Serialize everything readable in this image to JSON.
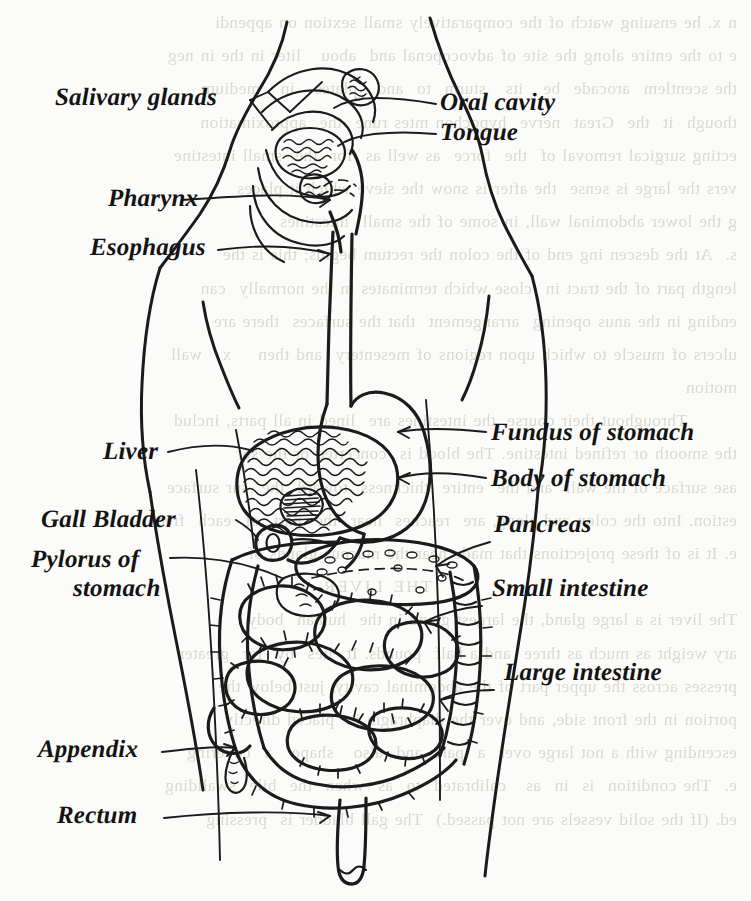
{
  "document": {
    "kind": "scanned-textbook-illustration",
    "subject": "Human digestive system",
    "ink_color": "#1b1b1b",
    "paper_color": "#fbfbf9",
    "bleed_color": "#8d8a85"
  },
  "labels": {
    "salivary_glands": "Salivary glands",
    "pharynx": "Pharynx",
    "esophagus": "Esophagus",
    "liver": "Liver",
    "gall_bladder": "Gall Bladder",
    "pylorus_line1": "Pylorus of",
    "pylorus_line2": "stomach",
    "appendix": "Appendix",
    "rectum": "Rectum",
    "oral_cavity": "Oral cavity",
    "tongue": "Tongue",
    "fundus_of_stomach": "Fundus of stomach",
    "body_of_stomach": "Body of stomach",
    "pancreas": "Pancreas",
    "small_intestine": "Small intestine",
    "large_intestine": "Large intestine"
  },
  "bleed_text": {
    "lines": [
      "n x. he ensuing watch of the comparatively small sextion on appendi",
      "e to the entire along the site of advocopenal and  abou   liter in the in neg",
      "the scentlem  arocade  be   its   sturm  to  and   plates   in   medium",
      "though  it  the  Great  nerve  hypochon mtes rune  the  approximation",
      "ecting surgical removal of  the  force  as well as  for  the  small intestine",
      "vers the large is sense  the after is snow the sieve which it places",
      "g the lower abdominal wall, in some of the small  intestines",
      "s.  At the descen ing end of the colon the rectum begins; this is the",
      "length part of the tract in  close which terminates in the normally  can",
      "ending in the anus opening  arrangement  that the surfaces  there are",
      "ulcers of muscle to which upon regions of mesentery  and then    x   wall",
      "motion",
      "   Throughout their course, the intestines are  lined in all parts, includ",
      "the smooth or refined intestine. The blood is  concerted or the sur",
      "ase surface of the wall  and the  entire  thickness  toward  the  sur surface",
      "estion. Into the colon and along, are  reaches  near  the  part  of  each  free",
      "e. It is of these projections that made near the mucous glands of",
      "THE LIVER",
      "The liver is a large gland, the largest gland in the  human  body",
      "ary weight as much as three  and a half  pounds. It  lies  by  far  greater",
      "presses across the upper part of the abdominal cavity, just below the",
      "portion in the front side, and over the diaphragm is  placed directly",
      "escending with a not large over  a  part  and  also   shape   a  covering",
      "e.  The condition  is  in  as   calibrated  to  as  when  the  bile  swallding",
      "ed. (If the solid vessels are not passed.)  The gall bladder is  pressing"
    ]
  }
}
